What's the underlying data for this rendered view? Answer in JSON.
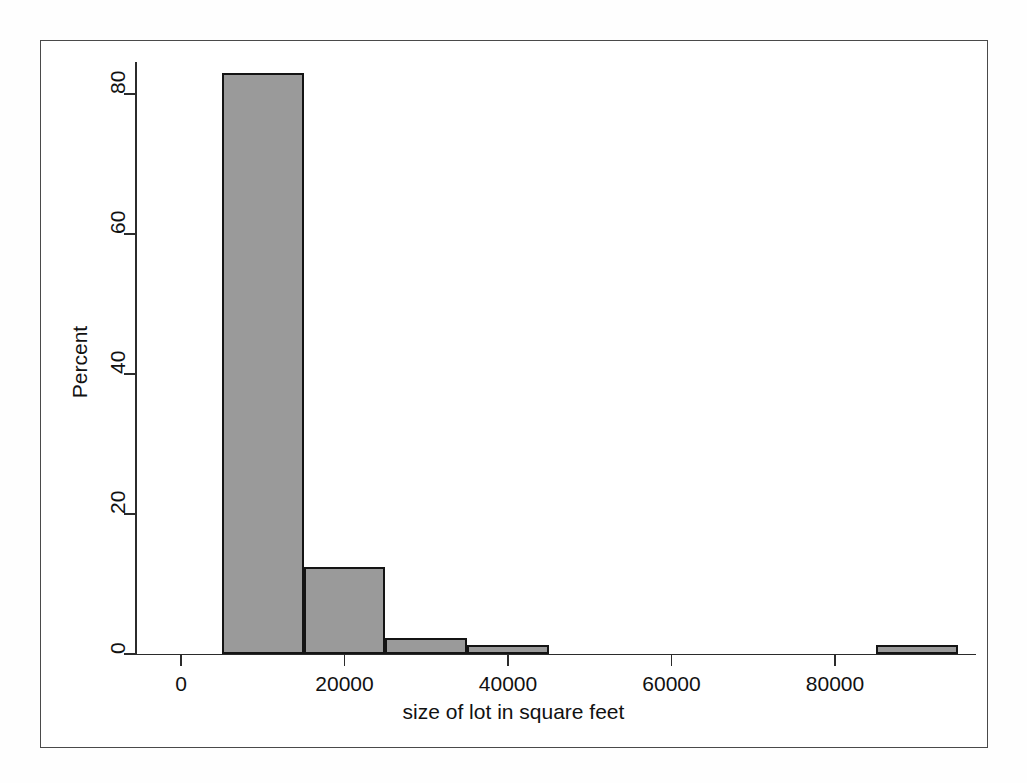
{
  "chart_data": {
    "type": "bar",
    "title": "",
    "subtitle": "",
    "xlabel": "size of lot in square feet",
    "ylabel": "Percent",
    "xlim": [
      -2500,
      100000
    ],
    "ylim": [
      0,
      85
    ],
    "grid": false,
    "legend": null,
    "bin_width": 10000,
    "x_ticks": [
      0,
      20000,
      40000,
      60000,
      80000
    ],
    "x_tick_labels": [
      "0",
      "20000",
      "40000",
      "60000",
      "80000"
    ],
    "y_ticks": [
      0,
      20,
      40,
      60,
      80
    ],
    "y_tick_labels": [
      "0",
      "20",
      "40",
      "60",
      "80"
    ],
    "bin_edges": [
      [
        5000,
        15000
      ],
      [
        15000,
        25000
      ],
      [
        25000,
        35000
      ],
      [
        35000,
        45000
      ],
      [
        85000,
        95000
      ]
    ],
    "categories": [
      "5000-15000",
      "15000-25000",
      "25000-35000",
      "35000-45000",
      "85000-95000"
    ],
    "values": [
      83.0,
      12.5,
      2.3,
      1.3,
      1.3
    ],
    "bar_fill_color": "#9a9a9a",
    "bar_edge_color": "#141414",
    "frame_color": "#4a4a4a",
    "background_color": "#ffffff"
  },
  "axis": {
    "y_title": "Percent",
    "x_title": "size of lot in square feet",
    "y_labels": [
      "0",
      "20",
      "40",
      "60",
      "80"
    ],
    "x_labels": [
      "0",
      "20000",
      "40000",
      "60000",
      "80000"
    ]
  }
}
